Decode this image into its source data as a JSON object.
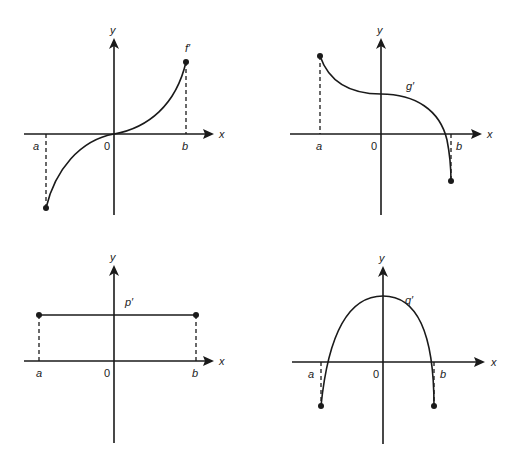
{
  "panels": [
    {
      "id": "f",
      "curve_label": "f′",
      "axis_x": "x",
      "axis_y": "y",
      "origin_label": "0",
      "left_label": "a",
      "right_label": "b",
      "shape": "increasing S-curve through origin, concave down left of 0, concave up right of 0"
    },
    {
      "id": "g",
      "curve_label": "g′",
      "axis_x": "x",
      "axis_y": "y",
      "origin_label": "0",
      "left_label": "a",
      "right_label": "b",
      "shape": "decreasing curve, flattening at positive y-intercept, crossing x-axis just before b"
    },
    {
      "id": "p",
      "curve_label": "p′",
      "axis_x": "x",
      "axis_y": "y",
      "origin_label": "0",
      "left_label": "a",
      "right_label": "b",
      "shape": "horizontal constant line above x-axis from a to b"
    },
    {
      "id": "q",
      "curve_label": "q′",
      "axis_x": "x",
      "axis_y": "y",
      "origin_label": "0",
      "left_label": "a",
      "right_label": "b",
      "shape": "downward parabola with maximum on y-axis, negative at a and b"
    }
  ],
  "colors": {
    "ink": "#1a1a1a",
    "background": "#ffffff"
  }
}
